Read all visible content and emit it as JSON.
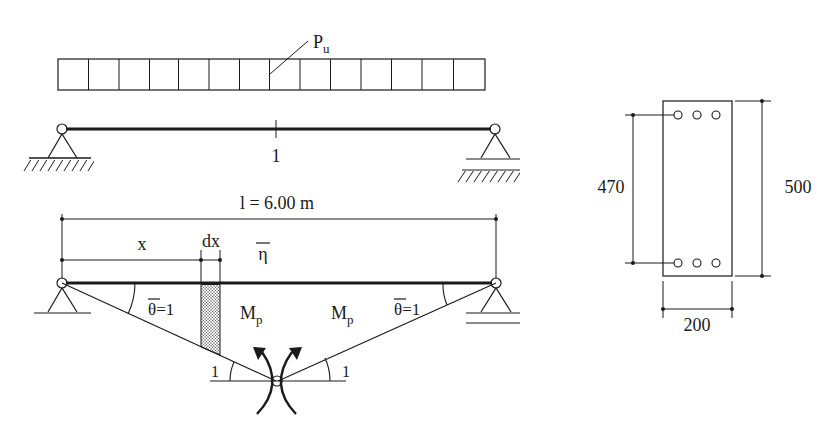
{
  "figure": {
    "top_beam": {
      "load_label": "P",
      "load_subscript": "u",
      "midspan_label": "1",
      "load_cells": 14
    },
    "bottom_beam": {
      "span_label": "l = 6.00 m",
      "x_label": "x",
      "dx_label": "dx",
      "eta_label": "η",
      "theta_left_label": "θ=1",
      "theta_right_label": "θ=1",
      "mp_left_label": "M",
      "mp_left_sub": "p",
      "mp_right_label": "M",
      "mp_right_sub": "p",
      "angle_left_label": "1",
      "angle_right_label": "1"
    },
    "cross_section": {
      "height_label": "500",
      "effective_depth_label": "470",
      "width_label": "200",
      "bars_top": 3,
      "bars_bottom": 3
    }
  }
}
